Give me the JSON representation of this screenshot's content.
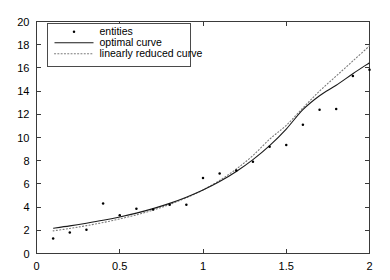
{
  "chart_data": {
    "type": "scatter",
    "title": "",
    "xlabel": "",
    "ylabel": "",
    "xlim": [
      0,
      2
    ],
    "ylim": [
      0,
      20
    ],
    "xticks": [
      0,
      0.5,
      1,
      1.5,
      2
    ],
    "xtick_labels": [
      "0",
      "0.5",
      "1",
      "1.5",
      "2"
    ],
    "yticks": [
      0,
      2,
      4,
      6,
      8,
      10,
      12,
      14,
      16,
      18,
      20
    ],
    "ytick_labels": [
      "0",
      "2",
      "4",
      "6",
      "8",
      "10",
      "12",
      "14",
      "16",
      "18",
      "20"
    ],
    "grid": false,
    "legend_position": "top-left",
    "legend": [
      {
        "label": "entities",
        "marker": "dot",
        "style": "marker",
        "color": "#000000"
      },
      {
        "label": "optimal curve",
        "marker": "none",
        "style": "solid",
        "color": "#1a1a1a"
      },
      {
        "label": "linearly reduced curve",
        "marker": "none",
        "style": "dotted",
        "color": "#7a7a7a"
      }
    ],
    "series": [
      {
        "name": "entities",
        "type": "scatter",
        "x": [
          0.1,
          0.2,
          0.3,
          0.4,
          0.5,
          0.6,
          0.7,
          0.8,
          0.9,
          1.0,
          1.1,
          1.2,
          1.3,
          1.4,
          1.5,
          1.6,
          1.7,
          1.8,
          1.9,
          2.0
        ],
        "y": [
          1.3,
          1.8,
          2.05,
          4.3,
          3.3,
          3.85,
          3.8,
          4.2,
          4.2,
          6.5,
          6.9,
          7.15,
          7.9,
          9.2,
          9.35,
          11.1,
          12.4,
          12.45,
          15.3,
          15.85
        ]
      },
      {
        "name": "optimal curve",
        "type": "line",
        "x": [
          0.1,
          0.2,
          0.3,
          0.4,
          0.5,
          0.6,
          0.7,
          0.8,
          0.9,
          1.0,
          1.1,
          1.2,
          1.3,
          1.4,
          1.5,
          1.6,
          1.7,
          1.8,
          1.9,
          2.0
        ],
        "y": [
          2.18,
          2.38,
          2.61,
          2.86,
          3.15,
          3.48,
          3.87,
          4.32,
          4.85,
          5.47,
          6.2,
          7.07,
          8.09,
          9.3,
          10.73,
          12.4,
          13.6,
          14.5,
          15.5,
          16.45
        ]
      },
      {
        "name": "linearly reduced curve",
        "type": "line",
        "x": [
          0.1,
          0.2,
          0.3,
          0.4,
          0.5,
          0.6,
          0.7,
          0.8,
          0.9,
          1.0,
          1.1,
          1.2,
          1.3,
          1.4,
          1.5,
          1.6,
          1.7,
          1.8,
          1.9,
          2.0
        ],
        "y": [
          1.95,
          2.16,
          2.4,
          2.67,
          2.98,
          3.33,
          3.74,
          4.23,
          4.8,
          5.48,
          6.3,
          7.28,
          8.45,
          9.85,
          11.05,
          12.55,
          14.0,
          15.3,
          16.6,
          17.9
        ]
      }
    ]
  },
  "figure": {
    "background_color": "#ffffff",
    "axis_color": "#3a3a3a"
  }
}
